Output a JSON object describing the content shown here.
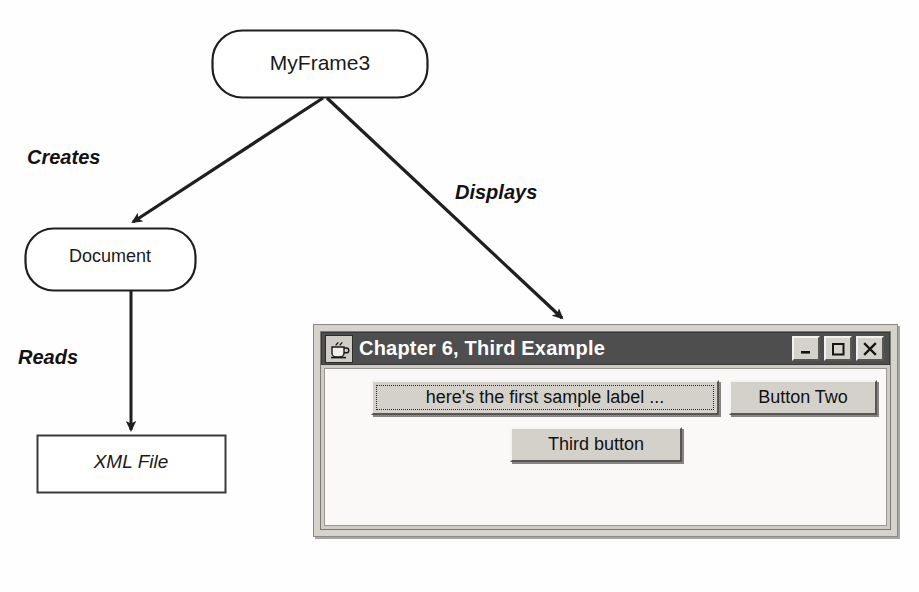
{
  "diagram": {
    "nodes": [
      {
        "id": "myframe3",
        "label": "MyFrame3",
        "shape": "rounded-rect"
      },
      {
        "id": "document",
        "label": "Document",
        "shape": "rounded-rect"
      },
      {
        "id": "xmlfile",
        "label": "XML File",
        "shape": "rect"
      }
    ],
    "edges": [
      {
        "from": "myframe3",
        "to": "document",
        "label": "Creates"
      },
      {
        "from": "myframe3",
        "to": "app-window",
        "label": "Displays"
      },
      {
        "from": "document",
        "to": "xmlfile",
        "label": "Reads"
      }
    ],
    "stroke_color": "#1f1f1f",
    "fill_color": "#ffffff"
  },
  "app_window": {
    "title": "Chapter 6, Third Example",
    "title_icon": "java-coffee-cup-icon",
    "title_bar_color": "#4e4e4e",
    "title_text_color": "#ffffff",
    "frame_color": "#d6d3cd",
    "content_color": "#faf9f7",
    "controls": [
      {
        "name": "minimize",
        "glyph": "_"
      },
      {
        "name": "maximize",
        "glyph": "square"
      },
      {
        "name": "close",
        "glyph": "X"
      }
    ],
    "buttons": [
      {
        "id": "first",
        "label": "here's the first sample label ...",
        "focused": true
      },
      {
        "id": "two",
        "label": "Button Two",
        "focused": false
      },
      {
        "id": "third",
        "label": "Third button",
        "focused": false
      }
    ]
  }
}
